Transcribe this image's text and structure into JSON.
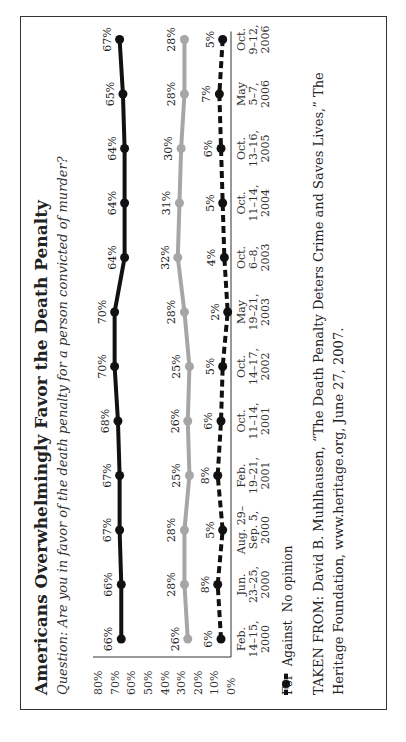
{
  "chart_data": {
    "type": "line",
    "title": "Americans Overwhelmingly Favor the Death Penalty",
    "subtitle": "Question: Are you in favor of the death penalty for a person convicted of murder?",
    "xlabel": "",
    "ylabel": "",
    "ylim": [
      0,
      80
    ],
    "yticks": [
      "80%",
      "70%",
      "60%",
      "50%",
      "40%",
      "30%",
      "20%",
      "10%",
      "0%"
    ],
    "categories": [
      [
        "Feb.",
        "14–15,",
        "2000"
      ],
      [
        "Jun.",
        "23–25,",
        "2000"
      ],
      [
        "Aug. 29–",
        "Sep. 5,",
        "2000"
      ],
      [
        "Feb.",
        "19–21,",
        "2001"
      ],
      [
        "Oct.",
        "11–14,",
        "2001"
      ],
      [
        "Oct.",
        "14–17,",
        "2002"
      ],
      [
        "May",
        "19–21,",
        "2003"
      ],
      [
        "Oct.",
        "6–8,",
        "2003"
      ],
      [
        "Oct.",
        "11–14,",
        "2004"
      ],
      [
        "Oct.",
        "13–16,",
        "2005"
      ],
      [
        "May",
        "5–7,",
        "2006"
      ],
      [
        "Oct.",
        "9–12,",
        "2006"
      ]
    ],
    "series": [
      {
        "name": "For",
        "color": "#111111",
        "style": "solid",
        "values": [
          66,
          66,
          67,
          67,
          68,
          70,
          70,
          64,
          64,
          64,
          65,
          67
        ]
      },
      {
        "name": "Against",
        "color": "#a6a6a6",
        "style": "solid",
        "values": [
          26,
          28,
          28,
          25,
          26,
          25,
          28,
          32,
          31,
          30,
          28,
          28
        ]
      },
      {
        "name": "No opinion",
        "color": "#111111",
        "style": "dashed",
        "values": [
          6,
          8,
          5,
          8,
          6,
          5,
          2,
          4,
          5,
          6,
          7,
          5
        ]
      }
    ],
    "grid": false,
    "legend_position": "bottom"
  },
  "legend": [
    {
      "label": "For"
    },
    {
      "label": "Against"
    },
    {
      "label": "No opinion"
    }
  ],
  "source": {
    "text": "TAKEN FROM: David B. Muhlhausen, “The Death Penalty Deters Crime and Saves Lives,” The Heritage Foundation, www.heritage.org, June 27, 2007."
  }
}
